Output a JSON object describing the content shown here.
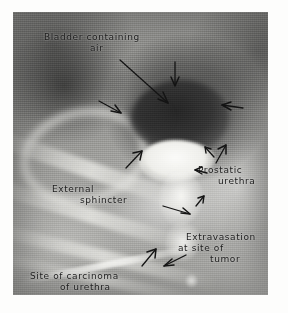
{
  "figure": {
    "kind": "annotated-radiograph",
    "modality": "urethrogram / cystogram X-ray",
    "plate_bounds": {
      "x": 13,
      "y": 12,
      "width": 255,
      "height": 283
    },
    "background_color": "#ffffff",
    "plate_base_color": "#9a9a97",
    "annotation_ink_color": "#1b1b1b"
  },
  "annotations": {
    "bladder": {
      "line1": "Bladder containing",
      "line2": "air"
    },
    "prostatic": {
      "line1": "Prostatic",
      "line2": "urethra"
    },
    "external_sphincter": {
      "line1": "External",
      "line2": "sphincter"
    },
    "extravasation": {
      "line1": "Extravasation",
      "line2": "at site of",
      "line3": "tumor"
    },
    "carcinoma_site": {
      "line1": "Site of carcinoma",
      "line2": "of urethra"
    }
  },
  "markers": [
    {
      "name": "arrow-bladder-top",
      "direction": "down",
      "tip_x": 175,
      "tip_y": 86
    },
    {
      "name": "arrow-bladder-leader",
      "direction": "down-right",
      "tip_x": 170,
      "tip_y": 104
    },
    {
      "name": "arrow-bladder-left",
      "direction": "left-down",
      "tip_x": 107,
      "tip_y": 112
    },
    {
      "name": "arrow-bladder-right",
      "direction": "left",
      "tip_x": 222,
      "tip_y": 106
    },
    {
      "name": "arrow-sphincter-upper-left",
      "direction": "up-right",
      "tip_x": 140,
      "tip_y": 152
    },
    {
      "name": "arrow-prostatic-upper",
      "direction": "up-right",
      "tip_x": 224,
      "tip_y": 146
    },
    {
      "name": "arrow-prostatic-lower",
      "direction": "up-left",
      "tip_x": 207,
      "tip_y": 146
    },
    {
      "name": "arrow-prostatic-side",
      "direction": "left",
      "tip_x": 196,
      "tip_y": 170
    },
    {
      "name": "arrow-sphincter-small",
      "direction": "up-right",
      "tip_x": 203,
      "tip_y": 198
    },
    {
      "name": "arrow-sphincter-lower",
      "direction": "down-right",
      "tip_x": 190,
      "tip_y": 214
    },
    {
      "name": "arrow-carcinoma",
      "direction": "up-right",
      "tip_x": 155,
      "tip_y": 250
    },
    {
      "name": "arrow-extravasation",
      "direction": "left-down",
      "tip_x": 165,
      "tip_y": 266
    }
  ]
}
